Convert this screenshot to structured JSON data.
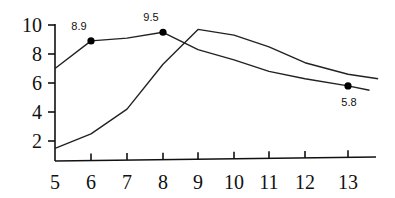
{
  "chart_data": {
    "type": "line",
    "title": "",
    "xlabel": "",
    "ylabel": "",
    "xlim": [
      5,
      13.7
    ],
    "ylim": [
      1.3,
      10
    ],
    "grid": false,
    "legend": null,
    "x_ticks": [
      5,
      6,
      7,
      8,
      9,
      10,
      11,
      12,
      13
    ],
    "x_tick_labels": [
      "5",
      "6",
      "7",
      "8",
      "9",
      "10",
      "11",
      "12",
      "13"
    ],
    "y_ticks": [
      2,
      4,
      6,
      8,
      10
    ],
    "y_tick_labels": [
      "2",
      "4",
      "6",
      "8",
      "10"
    ],
    "series": [
      {
        "name": "Series A (marked)",
        "x": [
          5,
          6,
          7,
          8,
          9,
          10,
          11,
          12,
          13,
          13.5
        ],
        "values": [
          7.0,
          8.9,
          9.1,
          9.5,
          8.3,
          7.6,
          6.8,
          6.3,
          5.8,
          5.5
        ],
        "markers": [
          {
            "x": 6,
            "y": 8.9,
            "label": "8.9"
          },
          {
            "x": 8,
            "y": 9.5,
            "label": "9.5"
          },
          {
            "x": 13,
            "y": 5.8,
            "label": "5.8"
          }
        ]
      },
      {
        "name": "Series B",
        "x": [
          5,
          6,
          7,
          8,
          9,
          10,
          11,
          12,
          13,
          13.7
        ],
        "values": [
          1.5,
          2.5,
          4.2,
          7.3,
          9.7,
          9.3,
          8.5,
          7.4,
          6.6,
          6.3
        ]
      }
    ]
  }
}
